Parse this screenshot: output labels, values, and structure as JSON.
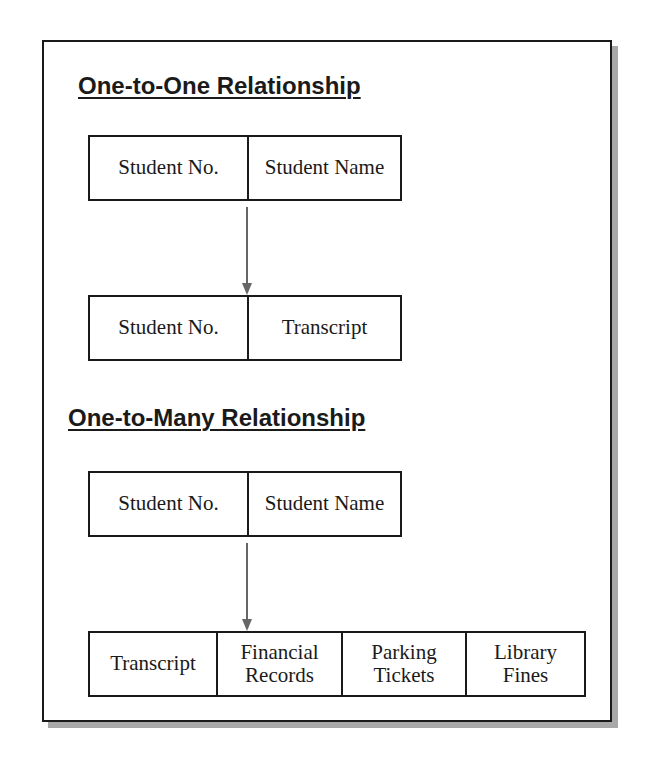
{
  "sections": [
    {
      "title": "One-to-One Relationship",
      "parent": [
        "Student No.",
        "Student Name"
      ],
      "child": [
        "Student No.",
        "Transcript"
      ]
    },
    {
      "title": "One-to-Many Relationship",
      "parent": [
        "Student No.",
        "Student Name"
      ],
      "children": [
        "Transcript",
        "Financial\nRecords",
        "Parking\nTickets",
        "Library\nFines"
      ]
    }
  ],
  "colors": {
    "border": "#1a1a1a",
    "arrow": "#666666",
    "shadow": "#a8a8a8"
  }
}
